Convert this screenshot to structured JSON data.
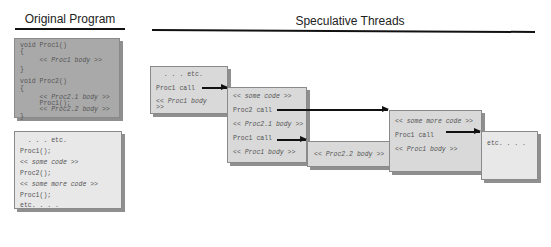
{
  "left_panel": {
    "title": "Original Program",
    "definitions": [
      {
        "text": "void Proc1()",
        "italic": false
      },
      {
        "text": "{",
        "italic": false
      },
      {
        "text": "     << Proc1 body >>",
        "italic": true
      },
      {
        "text": "}",
        "italic": false
      },
      {
        "text": "",
        "italic": false
      },
      {
        "text": "void Proc2()",
        "italic": false
      },
      {
        "text": "{",
        "italic": false
      },
      {
        "text": "     << Proc2.1 body >>",
        "italic": true
      },
      {
        "text": "     Proc1();",
        "italic": false
      },
      {
        "text": "     << Proc2.2 body >>",
        "italic": true
      },
      {
        "text": "}",
        "italic": false
      }
    ],
    "main": [
      {
        "text": "  . . . etc.",
        "italic": false
      },
      {
        "text": "Proc1();",
        "italic": false
      },
      {
        "text": "<< some code >>",
        "italic": false
      },
      {
        "text": "Proc2();",
        "italic": false
      },
      {
        "text": "<< some more code >>",
        "italic": false
      },
      {
        "text": "Proc1();",
        "italic": false
      },
      {
        "text": "etc. . . .",
        "italic": false
      }
    ]
  },
  "right_panel": {
    "title": "Speculative Threads",
    "threads": [
      {
        "lines": [
          "  . . . etc.",
          "Proc1 call",
          "<< Proc1 body",
          ">>"
        ]
      },
      {
        "lines": [
          "<< some code >>",
          "Proc2 call",
          "<< Proc2.1 body >>",
          "Proc1 call",
          "<< Proc1 body >>"
        ]
      },
      {
        "lines": [
          "<< Proc2.2 body >>"
        ]
      },
      {
        "lines": [
          "<< some more code >>",
          "Proc1 call",
          "<< Proc1 body >>"
        ]
      },
      {
        "lines": [
          "etc. . . ."
        ]
      }
    ]
  }
}
